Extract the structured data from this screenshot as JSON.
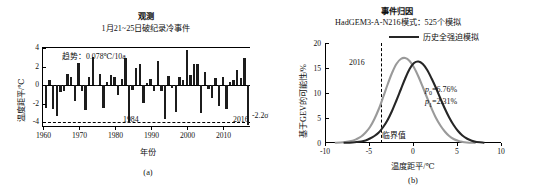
{
  "figure": {
    "panel_a_id": "(a)",
    "panel_b_id": "(b)"
  },
  "panel_a": {
    "title": "观测",
    "subtitle": "1月21~25日破纪录冷事件",
    "trend_annotation": "趋势：0.078℃/10a",
    "year_annotation_1984": "1984",
    "year_annotation_2016": "2016",
    "sigma_annotation": "-2.2σ",
    "xlabel": "年份",
    "ylabel": "温度距平/℃",
    "yticks": [
      "4",
      "2",
      "0",
      "-2",
      "-4"
    ],
    "xticks": [
      "1960",
      "1970",
      "1980",
      "1990",
      "2000",
      "2010"
    ]
  },
  "panel_b": {
    "title": "事件归因",
    "subtitle": "HadGEM3-A-N216模式：525个模拟",
    "legend": [
      {
        "label": "历史全强迫模拟",
        "color": "#262626"
      },
      {
        "label": "历史自然强迫模拟",
        "color": "#9a9a9a"
      }
    ],
    "year_annotation": "2016",
    "threshold_label": "临界值",
    "p0_label": "p",
    "p0_sub": "0",
    "p0_value": "=6.76%",
    "p1_label": "p",
    "p1_sub": "1",
    "p1_value": "=2.31%",
    "xlabel": "温度距平/℃",
    "ylabel": "基于GEV的可能性/%",
    "yticks": [
      "20",
      "15",
      "10",
      "5",
      "0"
    ],
    "xticks": [
      "-10",
      "-5",
      "0",
      "5",
      "10"
    ]
  },
  "chart_data": [
    {
      "type": "bar",
      "panel": "(a)",
      "title": "观测",
      "subtitle": "1月21~25日破纪录冷事件",
      "xlabel": "年份",
      "ylabel": "温度距平/℃",
      "xlim": [
        1959.2,
        2016.8
      ],
      "ylim": [
        -4.6,
        4.0
      ],
      "grid": false,
      "trend": "0.078℃/10a",
      "threshold_line_y": -4.0,
      "threshold_line_style": "dashed",
      "threshold_label": "-2.2σ",
      "x": [
        1960,
        1961,
        1962,
        1963,
        1964,
        1965,
        1966,
        1967,
        1968,
        1969,
        1970,
        1971,
        1972,
        1973,
        1974,
        1975,
        1976,
        1977,
        1978,
        1979,
        1980,
        1981,
        1982,
        1983,
        1984,
        1985,
        1986,
        1987,
        1988,
        1989,
        1990,
        1991,
        1992,
        1993,
        1994,
        1995,
        1996,
        1997,
        1998,
        1999,
        2000,
        2001,
        2002,
        2003,
        2004,
        2005,
        2006,
        2007,
        2008,
        2009,
        2010,
        2011,
        2012,
        2013,
        2014,
        2015,
        2016
      ],
      "values": [
        -2.4,
        0.6,
        -2.6,
        -3.3,
        -0.7,
        -0.6,
        1.2,
        0.9,
        -1.7,
        2.4,
        -0.6,
        -2.7,
        0.9,
        3.0,
        -0.1,
        1.2,
        -2.5,
        0.3,
        1.1,
        0.9,
        -1.1,
        0.7,
        2.9,
        -4.1,
        -0.5,
        1.8,
        2.3,
        -1.9,
        0.2,
        0.7,
        -0.6,
        2.6,
        -0.6,
        -3.6,
        1.0,
        -0.3,
        -2.9,
        0.9,
        0.6,
        3.8,
        1.1,
        2.3,
        2.3,
        -3.0,
        1.4,
        -0.4,
        -1.4,
        0.8,
        -2.2,
        0.9,
        -2.6,
        0.3,
        0.6,
        1.6,
        0.8,
        2.9,
        -4.3
      ],
      "annotations": [
        {
          "text": "1984",
          "x": 1984,
          "y": -3.6
        },
        {
          "text": "2016",
          "x": 2016,
          "y": -3.6
        }
      ]
    },
    {
      "type": "line",
      "panel": "(b)",
      "title": "事件归因",
      "subtitle": "HadGEM3-A-N216模式：525个模拟",
      "xlabel": "温度距平/℃",
      "ylabel": "基于GEV的可能性/%",
      "xlim": [
        -10,
        10
      ],
      "ylim": [
        0,
        20
      ],
      "grid": false,
      "legend_position": "top-right",
      "threshold_x": -3.8,
      "threshold_line_style": "dashed",
      "threshold_label": "临界值",
      "year_annotation": "2016",
      "series": [
        {
          "name": "历史全强迫模拟",
          "color": "#262626",
          "x": [
            -8,
            -7,
            -6,
            -5.5,
            -5,
            -4.5,
            -4,
            -3.5,
            -3,
            -2.5,
            -2,
            -1.5,
            -1,
            -0.5,
            0,
            0.5,
            1,
            1.5,
            2,
            2.5,
            3,
            3.5,
            4,
            4.5,
            5,
            5.5,
            6,
            6.5,
            7,
            8
          ],
          "y": [
            0.05,
            0.1,
            0.3,
            0.5,
            0.9,
            1.4,
            2.1,
            3.2,
            4.6,
            6.4,
            8.5,
            10.7,
            12.9,
            14.8,
            16.0,
            16.3,
            15.8,
            14.6,
            12.9,
            11.0,
            8.9,
            6.9,
            5.1,
            3.6,
            2.4,
            1.5,
            0.9,
            0.5,
            0.25,
            0.05
          ]
        },
        {
          "name": "历史自然强迫模拟",
          "color": "#9a9a9a",
          "x": [
            -9,
            -8,
            -7,
            -6.5,
            -6,
            -5.5,
            -5,
            -4.5,
            -4,
            -3.5,
            -3,
            -2.5,
            -2,
            -1.5,
            -1,
            -0.5,
            0,
            0.5,
            1,
            1.5,
            2,
            2.5,
            3,
            3.5,
            4,
            4.5,
            5,
            5.5,
            6,
            7
          ],
          "y": [
            0.05,
            0.15,
            0.45,
            0.8,
            1.3,
            2.1,
            3.2,
            4.8,
            6.8,
            9.2,
            11.7,
            14.0,
            15.8,
            16.8,
            17.0,
            16.4,
            15.1,
            13.3,
            11.2,
            9.0,
            6.9,
            5.0,
            3.5,
            2.3,
            1.4,
            0.8,
            0.45,
            0.22,
            0.1,
            0.03
          ]
        }
      ],
      "annotations": [
        {
          "text": "p0=6.76%",
          "x": 4.5,
          "y": 10.5
        },
        {
          "text": "p1=2.31%",
          "x": 4.5,
          "y": 8.5
        }
      ]
    }
  ]
}
